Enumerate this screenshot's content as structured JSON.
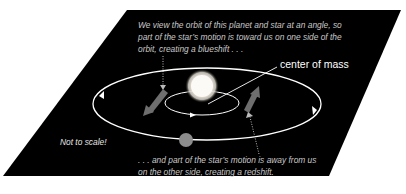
{
  "diagram": {
    "top_caption": {
      "lines": [
        "We view the orbit of this planet and star at an angle, so",
        "part of the star’s motion is toward us on one side of the",
        "orbit, creating a blueshift . . ."
      ]
    },
    "bottom_caption": {
      "lines": [
        ". . . and part of the star’s motion is away from us",
        "on the other side, creating a redshift."
      ]
    },
    "center_of_mass_label": "center of mass",
    "scale_note": "Not to scale!",
    "elements": {
      "star": "star",
      "planet": "planet",
      "planet_orbit": "planet-orbit",
      "star_orbit": "star-orbit",
      "blueshift_arrow": "motion-toward-arrow",
      "redshift_arrow": "motion-away-arrow"
    },
    "colors": {
      "background_plane": "#000000",
      "orbit_line": "#ffffff",
      "star": "#f4f1ea",
      "planet": "#8c8c8c",
      "motion_arrow": "#6e6e6e",
      "caption_text": "#c9c9c9"
    }
  }
}
